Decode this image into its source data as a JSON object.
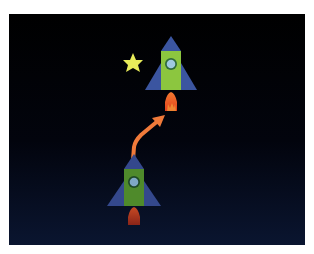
{
  "scene": {
    "description": "Illustration of a rocket launching upward in space",
    "background_top": "#000000",
    "background_bottom": "#0a1530",
    "colors": {
      "rocket_fin": "#3b55a0",
      "rocket_body_top": "#8cc63f",
      "rocket_body_bottom": "#4f8a2b",
      "window_ring_top": "#2f6b3a",
      "window_glass": "#9fc9e0",
      "flame_top": "#f05a1e",
      "flame_bottom": "#b6301c",
      "arrow": "#f07a3a",
      "star": "#e8ec5a"
    },
    "elements": [
      {
        "name": "rocket-start",
        "label": "Rocket at start position (bottom)"
      },
      {
        "name": "rocket-end",
        "label": "Rocket at end position (top)"
      },
      {
        "name": "motion-arrow",
        "label": "Curved arrow showing upward motion"
      },
      {
        "name": "star",
        "label": "Yellow star"
      }
    ]
  }
}
